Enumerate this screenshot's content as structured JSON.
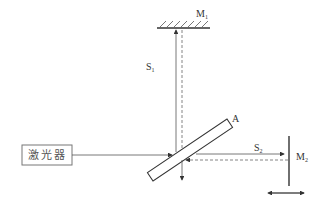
{
  "diagram": {
    "type": "Michelson interferometer schematic",
    "laser": {
      "label": "激光器"
    },
    "mirror_top": {
      "label": "M",
      "subscript": "1"
    },
    "mirror_right": {
      "label": "M",
      "subscript": "2"
    },
    "beam_splitter": {
      "label": "A"
    },
    "path_vertical": {
      "label": "S",
      "subscript": "1"
    },
    "path_horizontal": {
      "label": "S",
      "subscript": "2"
    },
    "colors": {
      "line": "#333333",
      "stroke_light": "#666666"
    }
  }
}
